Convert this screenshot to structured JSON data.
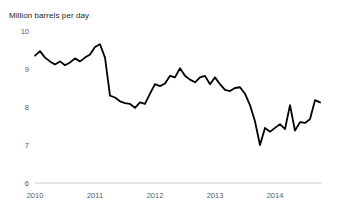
{
  "chart_data": {
    "type": "line",
    "title": "Million barrels per day",
    "xlabel": "",
    "ylabel": "Million barrels per day",
    "ylim": [
      6,
      10
    ],
    "xlim": [
      2010.0,
      2014.79
    ],
    "yticks": [
      "10",
      "9",
      "8",
      "7",
      "6"
    ],
    "ytick_values": [
      10,
      9,
      8,
      7,
      6
    ],
    "xticks": [
      "2010",
      "2011",
      "2012",
      "2013",
      "2014"
    ],
    "xtick_values": [
      2010,
      2011,
      2012,
      2013,
      2014
    ],
    "grid": false,
    "legend": null,
    "series": [
      {
        "name": "Million barrels per day",
        "color": "#000000",
        "x": [
          2010.0,
          2010.083,
          2010.167,
          2010.25,
          2010.333,
          2010.417,
          2010.5,
          2010.583,
          2010.667,
          2010.75,
          2010.833,
          2010.917,
          2011.0,
          2011.083,
          2011.167,
          2011.25,
          2011.333,
          2011.417,
          2011.5,
          2011.583,
          2011.667,
          2011.75,
          2011.833,
          2011.917,
          2012.0,
          2012.083,
          2012.167,
          2012.25,
          2012.333,
          2012.417,
          2012.5,
          2012.583,
          2012.667,
          2012.75,
          2012.833,
          2012.917,
          2013.0,
          2013.083,
          2013.167,
          2013.25,
          2013.333,
          2013.417,
          2013.5,
          2013.583,
          2013.667,
          2013.75,
          2013.833,
          2013.917,
          2014.0,
          2014.083,
          2014.167,
          2014.25,
          2014.333,
          2014.417,
          2014.5,
          2014.583,
          2014.667,
          2014.75
        ],
        "values": [
          9.35,
          9.47,
          9.3,
          9.2,
          9.12,
          9.2,
          9.1,
          9.17,
          9.28,
          9.2,
          9.3,
          9.38,
          9.58,
          9.65,
          9.3,
          8.3,
          8.25,
          8.15,
          8.1,
          8.08,
          7.98,
          8.12,
          8.08,
          8.35,
          8.6,
          8.55,
          8.62,
          8.82,
          8.78,
          9.02,
          8.82,
          8.72,
          8.65,
          8.78,
          8.82,
          8.6,
          8.78,
          8.6,
          8.45,
          8.42,
          8.5,
          8.52,
          8.35,
          8.05,
          7.62,
          7.0,
          7.45,
          7.35,
          7.45,
          7.55,
          7.42,
          8.05,
          7.38,
          7.6,
          7.58,
          7.68,
          8.18,
          8.12
        ]
      }
    ]
  },
  "axes": {
    "y_axis_name": "y-axis",
    "x_axis_name": "x-axis"
  }
}
